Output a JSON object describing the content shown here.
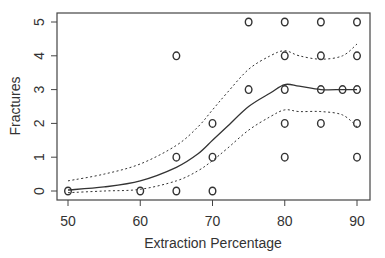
{
  "chart_data": {
    "type": "scatter",
    "title": "",
    "xlabel": "Extraction Percentage",
    "ylabel": "Fractures",
    "xlim": [
      48.5,
      92.5
    ],
    "ylim": [
      -0.2,
      5.3
    ],
    "x_ticks": [
      50,
      60,
      70,
      80,
      90
    ],
    "y_ticks": [
      0,
      1,
      2,
      3,
      4,
      5
    ],
    "grid": false,
    "legend": null,
    "points": [
      [
        50,
        0
      ],
      [
        60,
        0
      ],
      [
        65,
        0
      ],
      [
        65,
        1
      ],
      [
        65,
        4
      ],
      [
        70,
        0
      ],
      [
        70,
        1
      ],
      [
        70,
        2
      ],
      [
        75,
        3
      ],
      [
        75,
        5
      ],
      [
        80,
        1
      ],
      [
        80,
        2
      ],
      [
        80,
        3
      ],
      [
        80,
        4
      ],
      [
        80,
        5
      ],
      [
        85,
        2
      ],
      [
        85,
        3
      ],
      [
        85,
        4
      ],
      [
        85,
        5
      ],
      [
        88,
        3
      ],
      [
        90,
        1
      ],
      [
        90,
        2
      ],
      [
        90,
        3
      ],
      [
        90,
        4
      ],
      [
        90,
        5
      ]
    ],
    "series": [
      {
        "name": "fit",
        "style": "solid",
        "x": [
          50,
          55,
          60,
          65,
          68,
          70,
          72,
          75,
          78,
          80,
          82,
          85,
          88,
          90
        ],
        "y": [
          0.03,
          0.12,
          0.3,
          0.7,
          1.1,
          1.5,
          1.9,
          2.5,
          2.9,
          3.15,
          3.1,
          3.0,
          3.0,
          3.0
        ]
      },
      {
        "name": "upper",
        "style": "dotted",
        "x": [
          50,
          55,
          60,
          65,
          68,
          70,
          72,
          75,
          78,
          80,
          82,
          85,
          88,
          90
        ],
        "y": [
          0.3,
          0.5,
          0.8,
          1.35,
          1.9,
          2.4,
          2.9,
          3.6,
          4.0,
          4.15,
          4.0,
          3.9,
          4.0,
          4.35
        ]
      },
      {
        "name": "lower",
        "style": "dotted",
        "x": [
          50,
          55,
          60,
          65,
          68,
          70,
          72,
          75,
          78,
          80,
          82,
          85,
          88,
          90
        ],
        "y": [
          -0.05,
          0.0,
          0.05,
          0.3,
          0.6,
          0.9,
          1.25,
          1.8,
          2.2,
          2.4,
          2.35,
          2.35,
          2.25,
          1.9
        ]
      }
    ]
  }
}
